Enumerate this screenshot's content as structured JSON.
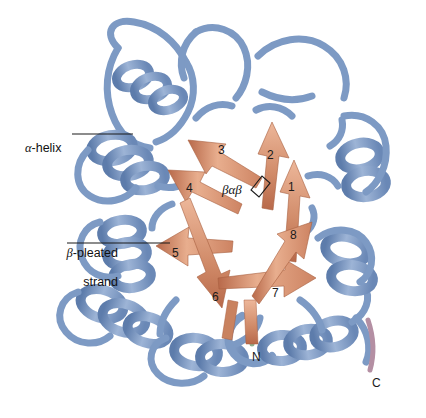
{
  "figure": {
    "background": "#ffffff",
    "colors": {
      "helix_blue": "#7d9ac4",
      "helix_blue_light": "#a9bedd",
      "helix_blue_dark": "#5d7cab",
      "strand_salmon": "#d99272",
      "strand_salmon_light": "#edb79a",
      "strand_salmon_dark": "#b8694a",
      "n_terminus_green": "#8fae8c",
      "c_terminus_mauve": "#b48fa3",
      "leader_line": "#1a1a1a",
      "label_text": "#111111"
    }
  },
  "callouts": {
    "alpha_helix": {
      "greek": "α",
      "rest": "-helix"
    },
    "beta_strand": {
      "greek": "β",
      "rest": "-pleated",
      "line2": "strand"
    },
    "bab_motif": "βαβ"
  },
  "strand_numbers": [
    {
      "label": "1",
      "x": 288,
      "y": 180
    },
    {
      "label": "2",
      "x": 267,
      "y": 148
    },
    {
      "label": "3",
      "x": 218,
      "y": 143
    },
    {
      "label": "4",
      "x": 186,
      "y": 181
    },
    {
      "label": "5",
      "x": 172,
      "y": 246
    },
    {
      "label": "6",
      "x": 212,
      "y": 290
    },
    {
      "label": "7",
      "x": 272,
      "y": 286
    },
    {
      "label": "8",
      "x": 290,
      "y": 228
    }
  ],
  "termini": [
    {
      "label": "N",
      "x": 252,
      "y": 350
    },
    {
      "label": "C",
      "x": 372,
      "y": 376
    }
  ]
}
